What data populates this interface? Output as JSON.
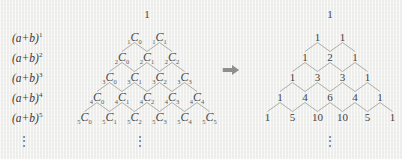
{
  "figure": {
    "type": "pascals-triangle-transformation",
    "background_color": "#f3f3f1",
    "text_color": "#40404 0",
    "line_color": "#9a9a9a"
  },
  "left_panel": {
    "apex_value": "1",
    "exponent_labels": [
      {
        "base": "(a+b)",
        "exponent": "1"
      },
      {
        "base": "(a+b)",
        "exponent": "2"
      },
      {
        "base": "(a+b)",
        "exponent": "3"
      },
      {
        "base": "(a+b)",
        "exponent": "4"
      },
      {
        "base": "(a+b)",
        "exponent": "5"
      }
    ],
    "ellipsis": "⋮",
    "triangle_ellipsis": "⋮",
    "rows": [
      {
        "n": "1",
        "cells": [
          {
            "n": "1",
            "c": "C",
            "r": "0"
          },
          {
            "n": "1",
            "c": "C",
            "r": "1"
          }
        ]
      },
      {
        "n": "2",
        "cells": [
          {
            "n": "2",
            "c": "C",
            "r": "0"
          },
          {
            "n": "2",
            "c": "C",
            "r": "1"
          },
          {
            "n": "2",
            "c": "C",
            "r": "2"
          }
        ]
      },
      {
        "n": "3",
        "cells": [
          {
            "n": "3",
            "c": "C",
            "r": "0"
          },
          {
            "n": "3",
            "c": "C",
            "r": "1"
          },
          {
            "n": "3",
            "c": "C",
            "r": "2"
          },
          {
            "n": "3",
            "c": "C",
            "r": "3"
          }
        ]
      },
      {
        "n": "4",
        "cells": [
          {
            "n": "4",
            "c": "C",
            "r": "0"
          },
          {
            "n": "4",
            "c": "C",
            "r": "1"
          },
          {
            "n": "4",
            "c": "C",
            "r": "2"
          },
          {
            "n": "4",
            "c": "C",
            "r": "3"
          },
          {
            "n": "4",
            "c": "C",
            "r": "4"
          }
        ]
      },
      {
        "n": "5",
        "cells": [
          {
            "n": "5",
            "c": "C",
            "r": "0"
          },
          {
            "n": "5",
            "c": "C",
            "r": "1"
          },
          {
            "n": "5",
            "c": "C",
            "r": "2"
          },
          {
            "n": "5",
            "c": "C",
            "r": "3"
          },
          {
            "n": "5",
            "c": "C",
            "r": "4"
          },
          {
            "n": "5",
            "c": "C",
            "r": "5"
          }
        ]
      }
    ]
  },
  "arrow": {
    "glyph": "right-block-arrow",
    "direction": "right"
  },
  "right_panel": {
    "apex_value": "1",
    "ellipsis": "⋮",
    "rows": [
      [
        "1",
        "1"
      ],
      [
        "1",
        "2",
        "1"
      ],
      [
        "1",
        "3",
        "3",
        "1"
      ],
      [
        "1",
        "4",
        "6",
        "4",
        "1"
      ],
      [
        "1",
        "5",
        "10",
        "10",
        "5",
        "1"
      ]
    ]
  },
  "chart_data": {
    "type": "diagram",
    "left_triangle_notation": [
      [
        "1C0",
        "1C1"
      ],
      [
        "2C0",
        "2C1",
        "2C2"
      ],
      [
        "3C0",
        "3C1",
        "3C2",
        "3C3"
      ],
      [
        "4C0",
        "4C1",
        "4C2",
        "4C3",
        "4C4"
      ],
      [
        "5C0",
        "5C1",
        "5C2",
        "5C3",
        "5C4",
        "5C5"
      ]
    ],
    "right_triangle_values": [
      [
        1
      ],
      [
        1,
        1
      ],
      [
        1,
        2,
        1
      ],
      [
        1,
        3,
        3,
        1
      ],
      [
        1,
        4,
        6,
        4,
        1
      ],
      [
        1,
        5,
        10,
        10,
        5,
        1
      ]
    ],
    "row_labels": [
      "(a+b)^1",
      "(a+b)^2",
      "(a+b)^3",
      "(a+b)^4",
      "(a+b)^5"
    ]
  }
}
